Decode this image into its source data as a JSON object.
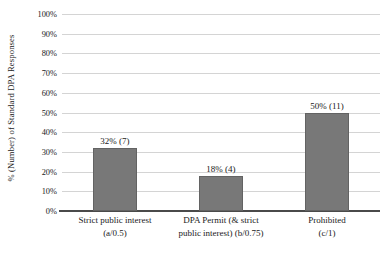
{
  "chart_data": {
    "type": "bar",
    "title": "",
    "xlabel": "",
    "ylabel": "% (Number) of Standard DPA Responses",
    "ylim": [
      0,
      100
    ],
    "grid": true,
    "legend": "none",
    "categories": [
      "Strict public interest (a/0.5)",
      "DPA Permit (& strict public interest) (b/0.75)",
      "Prohibited (c/1)"
    ],
    "category_lines": [
      [
        "Strict public interest",
        "(a/0.5)"
      ],
      [
        "DPA Permit (& strict",
        "public interest) (b/0.75)"
      ],
      [
        "Prohibited",
        "(c/1)"
      ]
    ],
    "values": [
      32,
      18,
      50
    ],
    "counts": [
      7,
      4,
      11
    ],
    "data_labels": [
      "32% (7)",
      "18% (4)",
      "50% (11)"
    ],
    "ytick_labels": [
      "100%",
      "90%",
      "80%",
      "70%",
      "60%",
      "50%",
      "40%",
      "30%",
      "20%",
      "10%",
      "0%"
    ],
    "ytick_values": [
      100,
      90,
      80,
      70,
      60,
      50,
      40,
      30,
      20,
      10,
      0
    ],
    "colors": {
      "bar_fill": "#787878",
      "bar_border": "#636363",
      "gridline": "#d4d4d4",
      "axis": "#4a4a4a",
      "text": "#1a1a1a",
      "background": "#ffffff"
    }
  }
}
